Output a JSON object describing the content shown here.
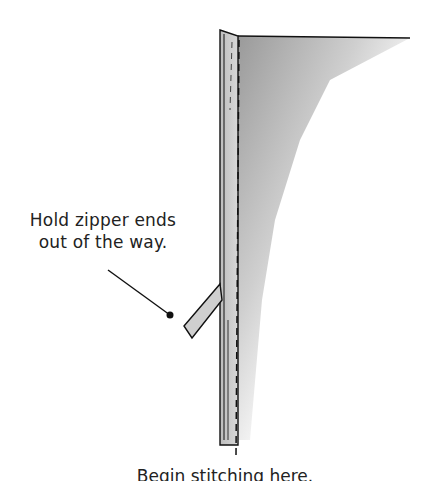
{
  "diagram": {
    "callout": {
      "line1": "Hold zipper ends",
      "line2": "out of the way."
    },
    "caption": "Begin stitching here."
  }
}
